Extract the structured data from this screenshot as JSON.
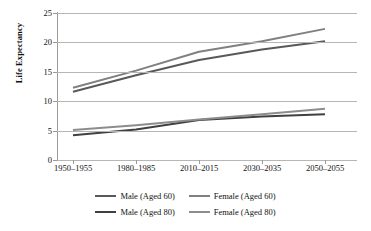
{
  "chart_data": {
    "type": "line",
    "title": "",
    "xlabel": "",
    "ylabel": "Life Expectancy",
    "categories": [
      "1950–1955",
      "1980–1985",
      "2010–2015",
      "2030–2035",
      "2050–2055"
    ],
    "ylim": [
      0,
      25
    ],
    "yticks": [
      0,
      5,
      10,
      15,
      20,
      25
    ],
    "grid": true,
    "legend_position": "bottom",
    "series": [
      {
        "name": "Male (Aged 60)",
        "color": "#595959",
        "values": [
          11.6,
          14.4,
          17.0,
          18.8,
          20.2
        ]
      },
      {
        "name": "Female (Aged 60)",
        "color": "#808080",
        "values": [
          12.3,
          15.2,
          18.4,
          20.2,
          22.3
        ]
      },
      {
        "name": "Male (Aged 80)",
        "color": "#404040",
        "values": [
          4.2,
          5.2,
          6.8,
          7.4,
          7.8
        ]
      },
      {
        "name": "Female (Aged 80)",
        "color": "#8c8c8c",
        "values": [
          5.1,
          5.9,
          6.9,
          7.8,
          8.7
        ]
      }
    ]
  },
  "axes": {
    "y_tick_labels": [
      "25",
      "20",
      "15",
      "10",
      "5",
      "0"
    ],
    "y_title": "Life Expectancy"
  },
  "legend": {
    "rows": [
      [
        {
          "label": "Male (Aged 60)",
          "color": "#595959"
        },
        {
          "label": "Female (Aged 60)",
          "color": "#808080"
        }
      ],
      [
        {
          "label": "Male (Aged 80)",
          "color": "#404040"
        },
        {
          "label": "Female (Aged 80)",
          "color": "#8c8c8c"
        }
      ]
    ]
  },
  "colors": {
    "gridline": "#b6b6b6",
    "axis": "#9a9a9a",
    "text": "#111111",
    "background": "#ffffff"
  }
}
